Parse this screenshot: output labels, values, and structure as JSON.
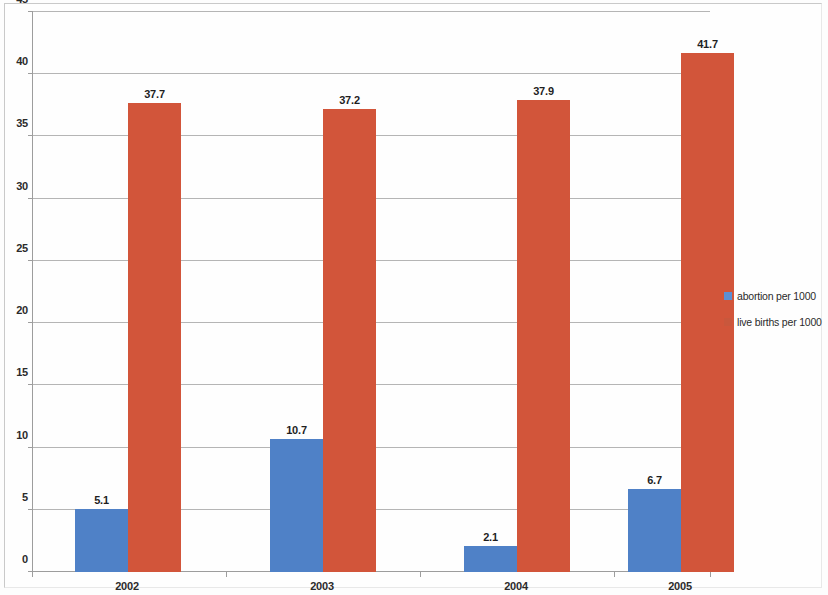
{
  "chart_data": {
    "type": "bar",
    "title": "",
    "subtitle": "",
    "xlabel": "",
    "ylabel": "",
    "categories": [
      "2002",
      "2003",
      "2004",
      "2005"
    ],
    "series": [
      {
        "name": "abortion per 1000",
        "color": "#4f81c7",
        "values": [
          5.1,
          10.7,
          2.1,
          6.7
        ],
        "labels": [
          "5.1",
          "10.7",
          "2.1",
          "6.7"
        ]
      },
      {
        "name": "live births per 1000",
        "color": "#d2553a",
        "values": [
          37.7,
          37.2,
          37.9,
          41.7
        ],
        "labels": [
          "37.7",
          "37.2",
          "37.9",
          "41.7"
        ]
      }
    ],
    "ylim": [
      0,
      45
    ],
    "yticks": [
      0,
      5,
      10,
      15,
      20,
      25,
      30,
      35,
      40,
      45
    ],
    "ytick_labels": [
      "0",
      "5",
      "10",
      "15",
      "20",
      "25",
      "30",
      "35",
      "40",
      "45"
    ],
    "grid": "horizontal",
    "legend_position": "right",
    "data_labels": true
  },
  "legend": {
    "items": [
      {
        "label": "abortion per 1000",
        "color": "#5b8fd4"
      },
      {
        "label": "live births per 1000",
        "color": "#c9573c"
      }
    ]
  }
}
